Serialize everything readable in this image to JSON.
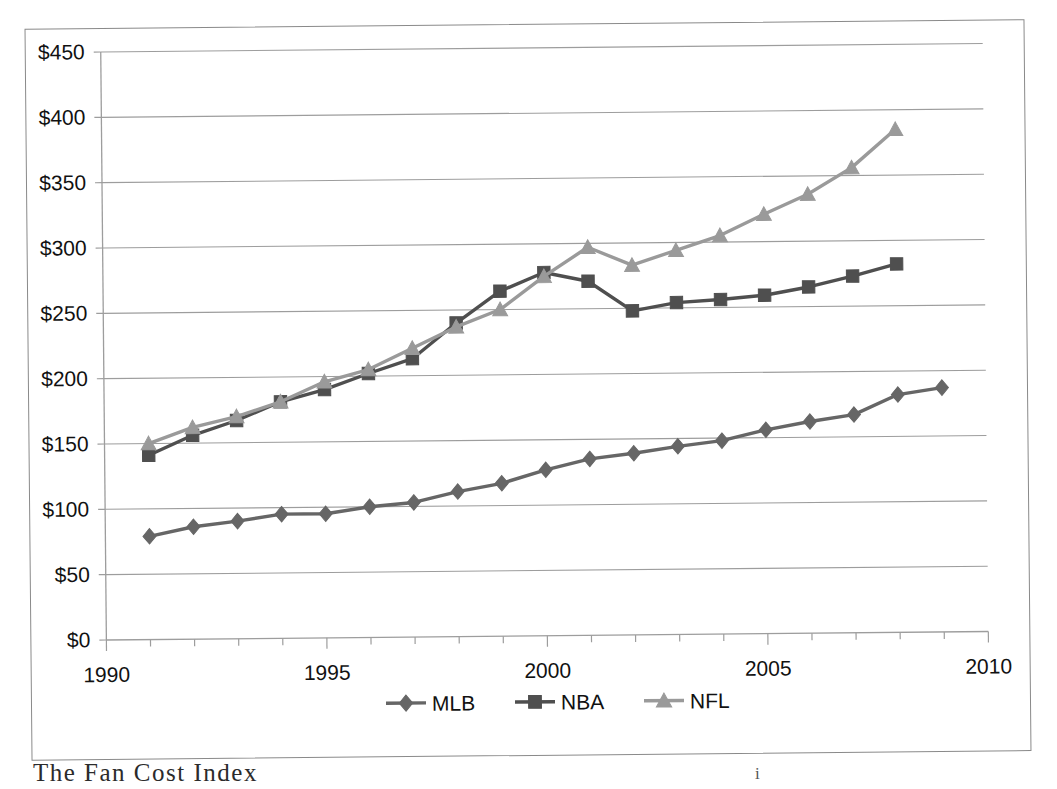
{
  "figure": {
    "caption_partial": "The Fan Cost Index ",
    "caption_mark": "i"
  },
  "chart_data": {
    "type": "line",
    "title": "",
    "xlabel": "",
    "ylabel": "",
    "xlim": [
      1990,
      2010
    ],
    "ylim": [
      0,
      450
    ],
    "grid": true,
    "y_tick_step": 50,
    "x_tick_step": 1,
    "x_label_step": 5,
    "legend_position": "bottom",
    "y_ticklabels": [
      "$0",
      "$50",
      "$100",
      "$150",
      "$200",
      "$250",
      "$300",
      "$350",
      "$400",
      "$450"
    ],
    "y_tickvalues": [
      0,
      50,
      100,
      150,
      200,
      250,
      300,
      350,
      400,
      450
    ],
    "x_ticklabels": [
      "1990",
      "1995",
      "2000",
      "2005",
      "2010"
    ],
    "x_tickvalues": [
      1990,
      1995,
      2000,
      2005,
      2010
    ],
    "series": [
      {
        "name": "MLB",
        "color": "#666666",
        "marker": "diamond",
        "x": [
          1991,
          1992,
          1993,
          1994,
          1995,
          1996,
          1997,
          1998,
          1999,
          2000,
          2001,
          2002,
          2003,
          2004,
          2005,
          2006,
          2007,
          2008,
          2009
        ],
        "values": [
          79,
          86,
          90,
          95,
          95,
          100,
          103,
          111,
          117,
          127,
          135,
          139,
          144,
          148,
          156,
          162,
          167,
          182,
          187
        ]
      },
      {
        "name": "NBA",
        "color": "#4f4f4f",
        "marker": "square",
        "x": [
          1991,
          1992,
          1993,
          1994,
          1995,
          1996,
          1997,
          1998,
          1999,
          2000,
          2001,
          2002,
          2003,
          2004,
          2005,
          2006,
          2007,
          2008
        ],
        "values": [
          141,
          156,
          167,
          181,
          190,
          202,
          213,
          240,
          264,
          278,
          271,
          248,
          254,
          256,
          259,
          265,
          273,
          282
        ]
      },
      {
        "name": "NFL",
        "color": "#9a9a9a",
        "marker": "triangle",
        "x": [
          1991,
          1992,
          1993,
          1994,
          1995,
          1996,
          1997,
          1998,
          1999,
          2000,
          2001,
          2002,
          2003,
          2004,
          2005,
          2006,
          2007,
          2008
        ],
        "values": [
          150,
          162,
          170,
          181,
          196,
          205,
          221,
          237,
          250,
          275,
          297,
          283,
          294,
          305,
          321,
          336,
          356,
          385
        ]
      }
    ]
  },
  "legend": {
    "items": [
      {
        "label": "MLB",
        "color": "#666666",
        "marker": "diamond"
      },
      {
        "label": "NBA",
        "color": "#4f4f4f",
        "marker": "square"
      },
      {
        "label": "NFL",
        "color": "#9a9a9a",
        "marker": "triangle"
      }
    ]
  }
}
